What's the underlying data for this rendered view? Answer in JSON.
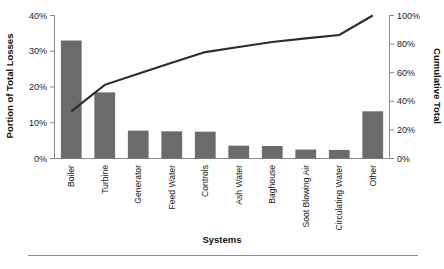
{
  "chart_data": {
    "type": "bar",
    "title": "",
    "xlabel": "Systems",
    "ylabel": "Portion of Total Losses",
    "y2label": "Cumulative Total",
    "categories": [
      "Boiler",
      "Turbine",
      "Generator",
      "Feed Water",
      "Controls",
      "Ash Water",
      "Baghouse",
      "Soot Blowing Air",
      "Circulating Water",
      "Other"
    ],
    "series": [
      {
        "name": "Portion of Total Losses",
        "type": "bar",
        "axis": "left",
        "values": [
          33,
          18.5,
          7.8,
          7.6,
          7.5,
          3.6,
          3.5,
          2.5,
          2.4,
          13.2
        ]
      },
      {
        "name": "Cumulative Total",
        "type": "line",
        "axis": "right",
        "values": [
          33,
          51.5,
          59.3,
          66.9,
          74.4,
          78,
          81.5,
          84,
          86.4,
          100
        ]
      }
    ],
    "ylim": [
      0,
      40
    ],
    "y2lim": [
      0,
      100
    ],
    "yticks": [
      "0%",
      "10%",
      "20%",
      "30%",
      "40%"
    ],
    "ytick_values": [
      0,
      10,
      20,
      30,
      40
    ],
    "y2ticks": [
      "0%",
      "20%",
      "40%",
      "60%",
      "80%",
      "100%"
    ],
    "y2tick_values": [
      0,
      20,
      40,
      60,
      80,
      100
    ],
    "grid": false,
    "legend": "none",
    "colors": {
      "bar": "#6b6b6b",
      "line": "#2b2b2b",
      "axis": "#8a8a8a",
      "text": "#1a1a1a",
      "background": "#ffffff"
    }
  }
}
